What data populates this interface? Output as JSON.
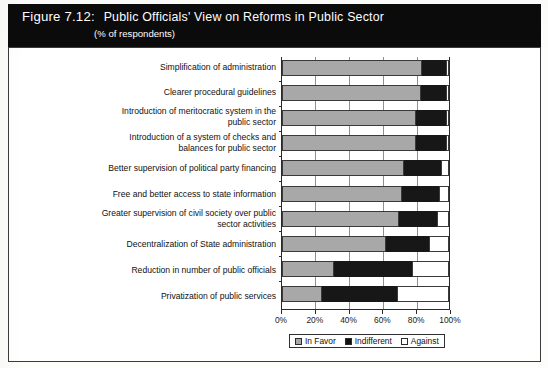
{
  "figure": {
    "label": "Figure 7.12:",
    "title": "Public Officials' View on Reforms in Public Sector",
    "subtitle": "(% of respondents)"
  },
  "colors": {
    "favor": "#a8a8a8",
    "indifferent": "#171717",
    "against": "#ffffff",
    "banner_bg": "#0b0b0b",
    "banner_text": "#ffffff",
    "axis": "#2a2a2a",
    "grid": "#8f8f8f"
  },
  "legend": {
    "position": "bottom-center",
    "items": [
      {
        "label": "In Favor",
        "key": "favor"
      },
      {
        "label": "Indifferent",
        "key": "indifferent"
      },
      {
        "label": "Against",
        "key": "against"
      }
    ]
  },
  "axis": {
    "xlabel": "",
    "ylabel": "",
    "ticks": [
      "0%",
      "20%",
      "40%",
      "60%",
      "80%",
      "100%"
    ],
    "xlim": [
      0,
      100
    ],
    "grid": true
  },
  "chart_data": {
    "type": "bar",
    "orientation": "horizontal",
    "stacked": true,
    "normalized_percent": true,
    "title": "Public Officials' View on Reforms in Public Sector",
    "subtitle": "(% of respondents)",
    "xlabel": "",
    "ylabel": "",
    "xlim": [
      0,
      100
    ],
    "xticks": [
      0,
      20,
      40,
      60,
      80,
      100
    ],
    "xticklabels": [
      "0%",
      "20%",
      "40%",
      "60%",
      "80%",
      "100%"
    ],
    "grid": true,
    "legend": [
      "In Favor",
      "Indifferent",
      "Against"
    ],
    "categories": [
      "Simplification of administration",
      "Clearer procedural guidelines",
      "Introduction of meritocratic system in the public sector",
      "Introduction of a system of checks and balances for public sector",
      "Better supervision of political party financing",
      "Free and better access to state information",
      "Greater supervision of civil society over public sector activities",
      "Decentralization of State administration",
      "Reduction in number of public officials",
      "Privatization of public services"
    ],
    "series": [
      {
        "name": "In Favor",
        "values": [
          84,
          83,
          80,
          80,
          73,
          72,
          70,
          62,
          31,
          24
        ]
      },
      {
        "name": "Indifferent",
        "values": [
          14,
          15,
          18,
          18,
          22,
          22,
          23,
          26,
          47,
          45
        ]
      },
      {
        "name": "Against",
        "values": [
          2,
          2,
          2,
          2,
          5,
          6,
          7,
          12,
          22,
          31
        ]
      }
    ]
  },
  "rows": [
    {
      "label_lines": [
        "Simplification of administration"
      ]
    },
    {
      "label_lines": [
        "Clearer procedural guidelines"
      ]
    },
    {
      "label_lines": [
        "Introduction of meritocratic system in the",
        "public sector"
      ]
    },
    {
      "label_lines": [
        "Introduction of a system of checks and",
        "balances for public sector"
      ]
    },
    {
      "label_lines": [
        "Better supervision of political party financing"
      ]
    },
    {
      "label_lines": [
        "Free and better access to state information"
      ]
    },
    {
      "label_lines": [
        "Greater supervision of civil society over public",
        "sector activities"
      ]
    },
    {
      "label_lines": [
        "Decentralization of State administration"
      ]
    },
    {
      "label_lines": [
        "Reduction in number of public officials"
      ]
    },
    {
      "label_lines": [
        "Privatization of public services"
      ]
    }
  ]
}
